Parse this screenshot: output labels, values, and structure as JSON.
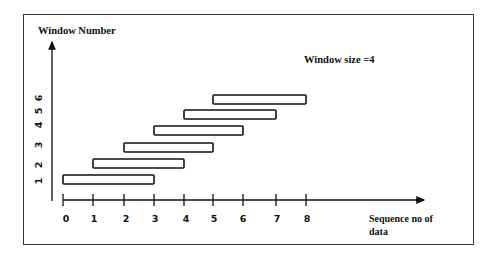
{
  "diagram": {
    "y_axis_label": "Window Number",
    "x_axis_label_line1": "Sequence no of",
    "x_axis_label_line2": "data",
    "annotation": "Window size =4",
    "x_ticks": [
      "0",
      "1",
      "2",
      "3",
      "4",
      "5",
      "6",
      "7",
      "8"
    ],
    "y_ticks": [
      "1",
      "2",
      "3",
      "4",
      "5",
      "6"
    ],
    "windows": [
      {
        "label": "1",
        "start": 0,
        "end": 3
      },
      {
        "label": "2",
        "start": 1,
        "end": 4
      },
      {
        "label": "3",
        "start": 2,
        "end": 5
      },
      {
        "label": "4",
        "start": 3,
        "end": 6
      },
      {
        "label": "5",
        "start": 4,
        "end": 7
      },
      {
        "label": "6",
        "start": 5,
        "end": 8
      }
    ],
    "colors": {
      "stroke": "#111111",
      "background": "#ffffff"
    }
  }
}
